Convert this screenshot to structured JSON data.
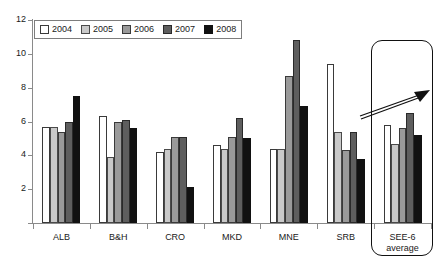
{
  "chart_data": {
    "type": "bar",
    "title": "",
    "xlabel": "",
    "ylabel": "",
    "ylim": [
      0,
      12
    ],
    "yticks": [
      0,
      2,
      4,
      6,
      8,
      10,
      12
    ],
    "grid": false,
    "legend_position": "top-left",
    "categories": [
      "ALB",
      "B&H",
      "CRO",
      "MKD",
      "MNE",
      "SRB",
      "SEE-6 average"
    ],
    "series": [
      {
        "name": "2004",
        "color": "#ffffff",
        "values": [
          5.7,
          6.3,
          4.2,
          4.6,
          4.4,
          9.4,
          5.8
        ]
      },
      {
        "name": "2005",
        "color": "#c9c9c9",
        "values": [
          5.7,
          3.9,
          4.4,
          4.4,
          4.4,
          5.4,
          4.7
        ]
      },
      {
        "name": "2006",
        "color": "#9a9a9a",
        "values": [
          5.4,
          6.0,
          5.1,
          5.1,
          8.7,
          4.3,
          5.6
        ]
      },
      {
        "name": "2007",
        "color": "#5e5e5e",
        "values": [
          6.0,
          6.1,
          5.1,
          6.2,
          10.8,
          5.4,
          6.5
        ]
      },
      {
        "name": "2008",
        "color": "#111111",
        "values": [
          7.5,
          5.6,
          2.1,
          5.0,
          6.9,
          3.8,
          5.2
        ]
      }
    ],
    "annotations": [
      {
        "name": "see6-highlight-box",
        "kind": "rounded-rect",
        "target": "SEE-6 average"
      },
      {
        "name": "upward-trend-arrow",
        "kind": "arrow",
        "direction": "up-right",
        "target": "SEE-6 average"
      }
    ]
  },
  "category_labels": [
    {
      "line1": "ALB",
      "line2": ""
    },
    {
      "line1": "B&H",
      "line2": ""
    },
    {
      "line1": "CRO",
      "line2": ""
    },
    {
      "line1": "MKD",
      "line2": ""
    },
    {
      "line1": "MNE",
      "line2": ""
    },
    {
      "line1": "SRB",
      "line2": ""
    },
    {
      "line1": "SEE-6",
      "line2": "average"
    }
  ],
  "top_caption": ""
}
